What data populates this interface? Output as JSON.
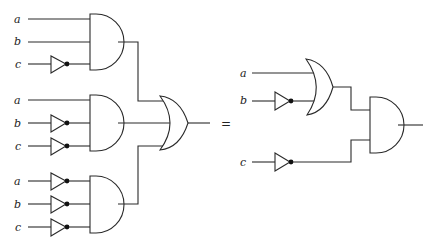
{
  "diagram": {
    "title": "",
    "equals_sign": "=",
    "left_circuit": {
      "description": "Sum of three AND terms feeding a 3-input OR gate",
      "and_gates": [
        {
          "id": "and1",
          "inputs": [
            {
              "label": "a",
              "inverted": false
            },
            {
              "label": "b",
              "inverted": false
            },
            {
              "label": "c",
              "inverted": true
            }
          ]
        },
        {
          "id": "and2",
          "inputs": [
            {
              "label": "a",
              "inverted": false
            },
            {
              "label": "b",
              "inverted": true
            },
            {
              "label": "c",
              "inverted": true
            }
          ]
        },
        {
          "id": "and3",
          "inputs": [
            {
              "label": "a",
              "inverted": true
            },
            {
              "label": "b",
              "inverted": true
            },
            {
              "label": "c",
              "inverted": true
            }
          ]
        }
      ],
      "or_gate": {
        "id": "or1",
        "inputs": [
          "and1",
          "and2",
          "and3"
        ]
      }
    },
    "right_circuit": {
      "description": "(a OR NOT b) AND NOT c",
      "or_gate": {
        "id": "or2",
        "inputs": [
          {
            "label": "a",
            "inverted": false
          },
          {
            "label": "b",
            "inverted": true
          }
        ]
      },
      "not_c": {
        "label": "c",
        "inverted": true
      },
      "and_gate": {
        "id": "and4",
        "inputs": [
          "or2",
          "not c"
        ]
      }
    },
    "labels": {
      "l1a": "a",
      "l1b": "b",
      "l1c": "c",
      "l2a": "a",
      "l2b": "b",
      "l2c": "c",
      "l3a": "a",
      "l3b": "b",
      "l3c": "c",
      "r_a": "a",
      "r_b": "b",
      "r_c": "c"
    },
    "colors": {
      "stroke": "#2a2a2a",
      "bubble": "#111111",
      "background": "#ffffff"
    }
  }
}
